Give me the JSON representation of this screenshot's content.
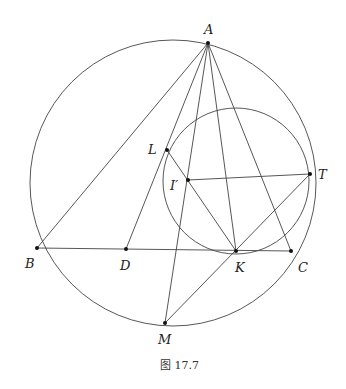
{
  "figure": {
    "caption": "图 17.7",
    "points": {
      "A": {
        "label": "A",
        "x": 208,
        "y": 43,
        "lx": 204,
        "ly": 34
      },
      "B": {
        "label": "B",
        "x": 37,
        "y": 248,
        "lx": 25,
        "ly": 268
      },
      "C": {
        "label": "C",
        "x": 291,
        "y": 251,
        "lx": 298,
        "ly": 272
      },
      "D": {
        "label": "D",
        "x": 126,
        "y": 249,
        "lx": 120,
        "ly": 270
      },
      "K": {
        "label": "K",
        "x": 236,
        "y": 251,
        "lx": 235,
        "ly": 272
      },
      "M": {
        "label": "M",
        "x": 165,
        "y": 323,
        "lx": 158,
        "ly": 344
      },
      "L": {
        "label": "L",
        "x": 167,
        "y": 150,
        "lx": 148,
        "ly": 154
      },
      "Iprime": {
        "label": "I′",
        "x": 188,
        "y": 180,
        "lx": 170,
        "ly": 190
      },
      "T": {
        "label": "T",
        "x": 310,
        "y": 174,
        "lx": 318,
        "ly": 179
      }
    },
    "circumcircle": {
      "cx": 173,
      "cy": 183,
      "r": 143
    },
    "mixtilinear_circle": {
      "cx": 236,
      "cy": 181,
      "r": 73
    }
  }
}
